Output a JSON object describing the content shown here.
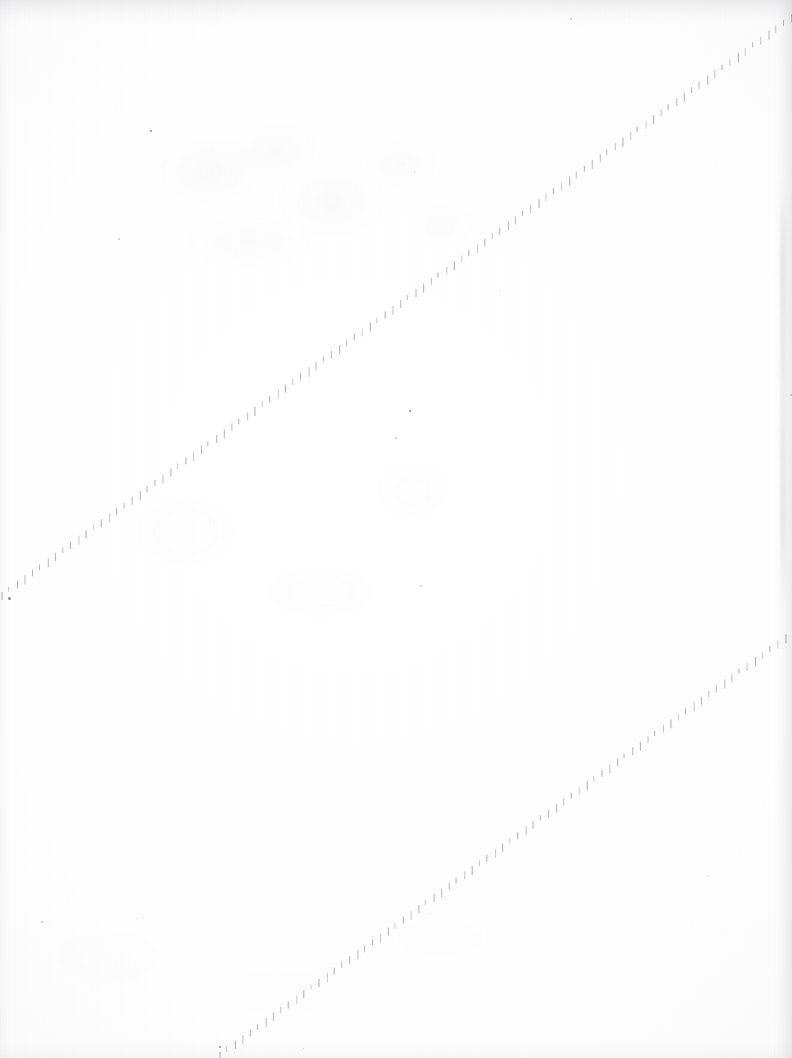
{
  "document": {
    "title": "Scanned blank page",
    "page_label": "",
    "visible_text": [],
    "background_color": "#ffffff",
    "paper_tone": "#fdfdfd",
    "ink_color": "#787a84",
    "width_px": 792,
    "height_px": 1058
  },
  "artifacts": {
    "dashed_lines": [
      {
        "name": "upper-diagonal-dashed-line",
        "description": "faint dashed diagonal perforation line running from lower-left to upper-right",
        "x1": -6,
        "y1": 602,
        "x2": 792,
        "y2": 18,
        "dash_spacing_px": 9.5,
        "dash_height_px": 8,
        "color": "#787a84"
      },
      {
        "name": "lower-diagonal-dashed-line",
        "description": "second faint dashed diagonal line, parallel, lower right portion of page",
        "x1": 212,
        "y1": 1062,
        "x2": 792,
        "y2": 634,
        "dash_spacing_px": 9.5,
        "dash_height_px": 8,
        "color": "#787a84"
      }
    ],
    "edge_shadows": [
      {
        "name": "top-scan-shadow",
        "edge": "top",
        "thickness_px": 26,
        "color": "#96969b"
      },
      {
        "name": "right-scan-shadow",
        "edge": "right",
        "thickness_px": 20,
        "color": "#8c8c94"
      },
      {
        "name": "bottom-scan-shadow",
        "edge": "bottom",
        "thickness_px": 16,
        "color": "#a0a0a6"
      },
      {
        "name": "left-scan-shadow",
        "edge": "left",
        "thickness_px": 10,
        "color": "#a5a5ac"
      }
    ],
    "smudges": [
      {
        "name": "upper-left-residue",
        "x": 150,
        "y": 120,
        "width": 330,
        "height": 170
      },
      {
        "name": "mid-left-residue",
        "x": 60,
        "y": 440,
        "width": 420,
        "height": 230
      },
      {
        "name": "lower-left-residue",
        "x": 40,
        "y": 880,
        "width": 500,
        "height": 160
      }
    ],
    "specks": [
      {
        "x": 150,
        "y": 130,
        "size": 2,
        "faint": false
      },
      {
        "x": 118,
        "y": 238,
        "size": 2,
        "faint": true
      },
      {
        "x": 409,
        "y": 410,
        "size": 2,
        "faint": false
      },
      {
        "x": 395,
        "y": 437,
        "size": 2,
        "faint": true
      },
      {
        "x": 420,
        "y": 585,
        "size": 2,
        "faint": true
      },
      {
        "x": 570,
        "y": 18,
        "size": 2,
        "faint": true
      },
      {
        "x": 414,
        "y": 172,
        "size": 1,
        "faint": true
      },
      {
        "x": 500,
        "y": 290,
        "size": 1,
        "faint": true
      },
      {
        "x": 8,
        "y": 597,
        "size": 3,
        "faint": false
      },
      {
        "x": 790,
        "y": 394,
        "size": 2,
        "faint": true
      },
      {
        "x": 41,
        "y": 921,
        "size": 2,
        "faint": true
      },
      {
        "x": 430,
        "y": 913,
        "size": 1,
        "faint": true
      },
      {
        "x": 136,
        "y": 918,
        "size": 1,
        "faint": true
      },
      {
        "x": 219,
        "y": 1046,
        "size": 2,
        "faint": false
      },
      {
        "x": 708,
        "y": 876,
        "size": 1,
        "faint": true
      },
      {
        "x": 303,
        "y": 1048,
        "size": 1,
        "faint": true
      }
    ]
  }
}
